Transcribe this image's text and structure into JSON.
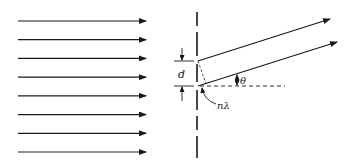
{
  "diagram": {
    "incident_wave_count": 8,
    "labels": {
      "slit_spacing": "d",
      "angle": "θ",
      "path_difference": "nλ"
    },
    "colors": {
      "ink": "#1a1a1a",
      "background": "#ffffff"
    }
  }
}
